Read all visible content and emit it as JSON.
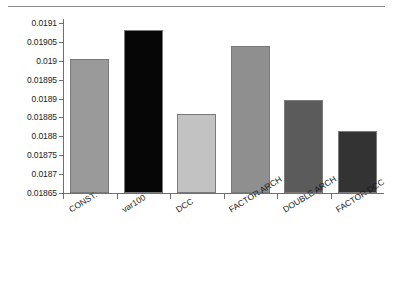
{
  "chart_data": {
    "type": "bar",
    "title": "",
    "subtitle": "",
    "xlabel": "",
    "ylabel": "",
    "categories": [
      "CONST.",
      "var100",
      "DCC",
      "FACTOR ARCH",
      "DOUBLE ARCH",
      "FACTOR DCC"
    ],
    "values": [
      0.019005,
      0.019082,
      0.018859,
      0.019039,
      0.018896,
      0.018814
    ],
    "bar_colors": [
      "#9a9a9a",
      "#060606",
      "#c2c2c2",
      "#8f8f8f",
      "#5b5b5b",
      "#333333"
    ],
    "ylim": [
      0.01865,
      0.0191
    ],
    "ytick_labels": [
      "0.0191",
      "0.01905",
      "0.019",
      "0.01895",
      "0.0189",
      "0.01885",
      "0.0188",
      "0.01875",
      "0.0187",
      "0.01865"
    ],
    "ytick_values": [
      0.0191,
      0.01905,
      0.019,
      0.01895,
      0.0189,
      0.01885,
      0.0188,
      0.01875,
      0.0187,
      0.01865
    ],
    "grid": false,
    "legend": "none",
    "axis_color": "#6f6f6f",
    "background": "#ffffff"
  }
}
